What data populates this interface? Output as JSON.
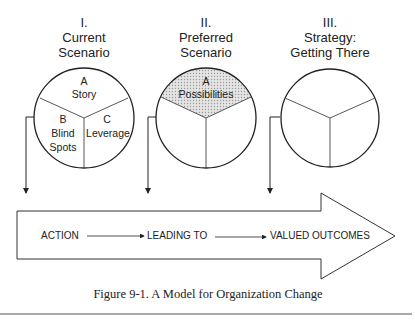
{
  "figure": {
    "caption": "Figure 9-1. A Model for Organization Change"
  },
  "stages": [
    {
      "numeral": "I.",
      "title_line1": "Current",
      "title_line2": "Scenario",
      "segments": {
        "top_letter": "A",
        "top_label": "Story",
        "left_letter": "B",
        "left_label1": "Blind",
        "left_label2": "Spots",
        "right_letter": "C",
        "right_label": "Leverage"
      },
      "highlighted_segment": null
    },
    {
      "numeral": "II.",
      "title_line1": "Preferred",
      "title_line2": "Scenario",
      "segments": {
        "top_letter": "A",
        "top_label": "Possibilities"
      },
      "highlighted_segment": "top"
    },
    {
      "numeral": "III.",
      "title_line1": "Strategy:",
      "title_line2": "Getting There",
      "segments": {},
      "highlighted_segment": null
    }
  ],
  "flow_arrow": {
    "steps": [
      "ACTION",
      "LEADING TO",
      "VALUED OUTCOMES"
    ]
  },
  "colors": {
    "line": "#222222",
    "highlight_fill": "#d6d6d6",
    "background": "#ffffff"
  }
}
